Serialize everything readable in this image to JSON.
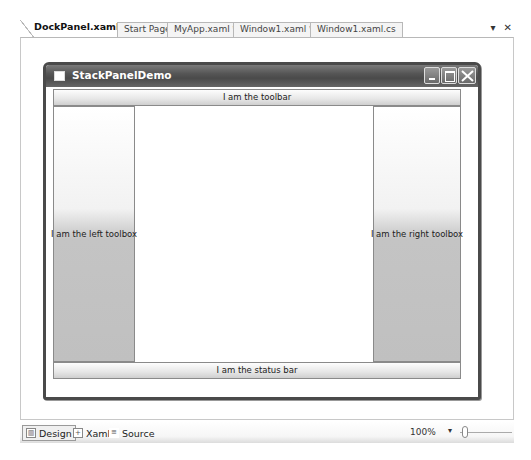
{
  "tabs": [
    {
      "label": "DockPanel.xaml *",
      "active": true
    },
    {
      "label": "Start Page",
      "active": false
    },
    {
      "label": "MyApp.xaml *",
      "active": false
    },
    {
      "label": "Window1.xaml *",
      "active": false
    },
    {
      "label": "Window1.xaml.cs",
      "active": false
    }
  ],
  "tab_menu": {
    "dropdown_icon": "▾",
    "close_icon": "✕"
  },
  "window": {
    "title": "StackPanelDemo",
    "toolbar": "I am the toolbar",
    "left_toolbox": "I am the left toolbox",
    "right_toolbox": "I am the right toolbox",
    "status_bar": "I am the status bar"
  },
  "bottom_bar": {
    "design": "Design",
    "xaml": "Xaml",
    "source": "Source",
    "zoom": "100%",
    "zoom_dropdown": "▾"
  }
}
